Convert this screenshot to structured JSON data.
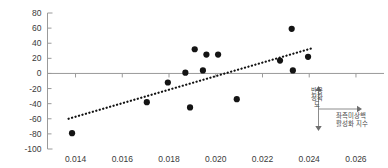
{
  "chart_data": {
    "type": "scatter",
    "title": "",
    "subtitle": "",
    "xlabel": "좌측미상핵 활성화 지수",
    "ylabel": "반응정확도",
    "xlim": [
      0.0128,
      0.0272
    ],
    "ylim": [
      -100,
      80
    ],
    "xticks": [
      0.014,
      0.016,
      0.018,
      0.02,
      0.022,
      0.024,
      0.026
    ],
    "xtick_labels": [
      "0.014",
      "0.016",
      "0.018",
      "0.020",
      "0.022",
      "0.024",
      "0.026"
    ],
    "yticks": [
      80,
      60,
      40,
      20,
      0,
      -20,
      -40,
      -60,
      -80,
      -100
    ],
    "ytick_labels": [
      "80",
      "60",
      "40",
      "20",
      "0",
      "-20",
      "-40",
      "-60",
      "-80",
      "-100"
    ],
    "grid": false,
    "legend": null,
    "zero_line": 0,
    "points": [
      {
        "x": 0.01385,
        "y": -79
      },
      {
        "x": 0.01705,
        "y": -38
      },
      {
        "x": 0.01795,
        "y": -12
      },
      {
        "x": 0.0187,
        "y": 1
      },
      {
        "x": 0.0189,
        "y": -45
      },
      {
        "x": 0.0191,
        "y": 32
      },
      {
        "x": 0.01945,
        "y": 4
      },
      {
        "x": 0.0196,
        "y": 25
      },
      {
        "x": 0.0201,
        "y": 25
      },
      {
        "x": 0.0209,
        "y": -34
      },
      {
        "x": 0.02275,
        "y": 17
      },
      {
        "x": 0.02325,
        "y": 59
      },
      {
        "x": 0.0233,
        "y": 4
      },
      {
        "x": 0.02395,
        "y": 22
      }
    ],
    "trendline": {
      "style": "dotted",
      "x0": 0.0137,
      "y0": -60,
      "x1": 0.0242,
      "y1": 34
    },
    "annotations": {
      "y_axis_marker": {
        "label": "반응정확도",
        "up_arrow": true,
        "down_arrow": true
      },
      "x_axis_marker": {
        "label_line1": "좌측미상핵",
        "label_line2": "활성화 지수",
        "right_arrow": true
      }
    }
  },
  "colors": {
    "point": "#141414",
    "trend": "#111111",
    "axis": "#9a9a9a",
    "text": "#3a3a3a",
    "annotation": "#4a4a4a",
    "background": "#ffffff"
  }
}
